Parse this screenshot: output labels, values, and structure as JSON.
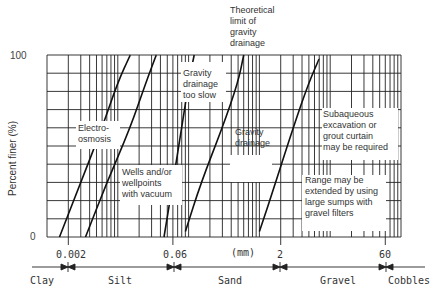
{
  "chart_data": {
    "type": "line",
    "title": "",
    "xlabel": "(mm)",
    "ylabel": "Percent finer (%)",
    "xscale": "log",
    "xlim": [
      0.001,
      100
    ],
    "ylim": [
      0,
      100
    ],
    "y_ticks": [
      "0",
      "100"
    ],
    "x_ticks": [
      "0.002",
      "0.06",
      "2",
      "60"
    ],
    "grid": true,
    "soil_classes": [
      "Clay",
      "Silt",
      "Sand",
      "Gravel",
      "Cobbles"
    ],
    "series": [
      {
        "name": "curve-1",
        "x": [
          0.0015,
          0.003,
          0.006,
          0.01,
          0.015
        ],
        "y": [
          0,
          30,
          60,
          85,
          100
        ]
      },
      {
        "name": "curve-2",
        "x": [
          0.0035,
          0.007,
          0.015,
          0.025,
          0.035
        ],
        "y": [
          0,
          30,
          60,
          85,
          100
        ]
      },
      {
        "name": "curve-3",
        "x": [
          0.045,
          0.06,
          0.08,
          0.1,
          0.12
        ],
        "y": [
          0,
          30,
          60,
          85,
          100
        ]
      },
      {
        "name": "curve-4",
        "x": [
          0.09,
          0.15,
          0.3,
          0.5,
          0.6
        ],
        "y": [
          3,
          30,
          60,
          85,
          100
        ]
      },
      {
        "name": "curve-5",
        "x": [
          1.0,
          1.7,
          3.0,
          5.0,
          7.0
        ],
        "y": [
          3,
          30,
          60,
          85,
          98
        ]
      }
    ],
    "annotations": [
      "Electro-osmosis",
      "Wells and/or wellpoints with vacuum",
      "Gravity drainage too slow",
      "Theoretical limit of gravity drainage",
      "Gravity drainage",
      "Subaqueous excavation or grout curtain may be required",
      "Range may be extended by using large sumps with gravel filters"
    ]
  },
  "labels": {
    "y_top": "100",
    "y_bottom": "0",
    "y_axis": "Percent finer (%)",
    "x_unit": "(mm)",
    "tick_0002": "0.002",
    "tick_006": "0.06",
    "tick_2": "2",
    "tick_60": "60",
    "clay": "Clay",
    "silt": "Silt",
    "sand": "Sand",
    "gravel": "Gravel",
    "cobbles": "Cobbles",
    "electro_1": "Electro-",
    "electro_2": "osmosis",
    "wells_1": "Wells and/or",
    "wells_2": "wellpoints",
    "wells_3": "with vacuum",
    "slow_1": "Gravity",
    "slow_2": "drainage",
    "slow_3": "too slow",
    "theo_1": "Theoretical",
    "theo_2": "limit of",
    "theo_3": "gravity",
    "theo_4": "drainage",
    "grav_1": "Gravity",
    "grav_2": "drainage",
    "sub_1": "Subaqueous",
    "sub_2": "excavation or",
    "sub_3": "grout curtain",
    "sub_4": "may be required",
    "range_1": "Range may be",
    "range_2": "extended by using",
    "range_3": "large sumps with",
    "range_4": "gravel filters"
  }
}
